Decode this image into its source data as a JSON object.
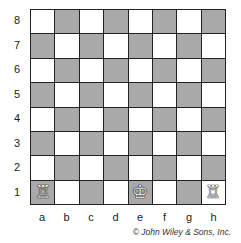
{
  "board": {
    "ranks": [
      "8",
      "7",
      "6",
      "5",
      "4",
      "3",
      "2",
      "1"
    ],
    "files": [
      "a",
      "b",
      "c",
      "d",
      "e",
      "f",
      "g",
      "h"
    ],
    "colors": {
      "light": "#ffffff",
      "dark": "#a9a9a9",
      "border": "#222222"
    },
    "pieces": [
      {
        "square": "a1",
        "piece": "white-rook",
        "glyph": "♖"
      },
      {
        "square": "e1",
        "piece": "white-king",
        "glyph": "♔"
      },
      {
        "square": "h1",
        "piece": "white-rook",
        "glyph": "♖"
      }
    ]
  },
  "credit": "© John Wiley & Sons, Inc."
}
